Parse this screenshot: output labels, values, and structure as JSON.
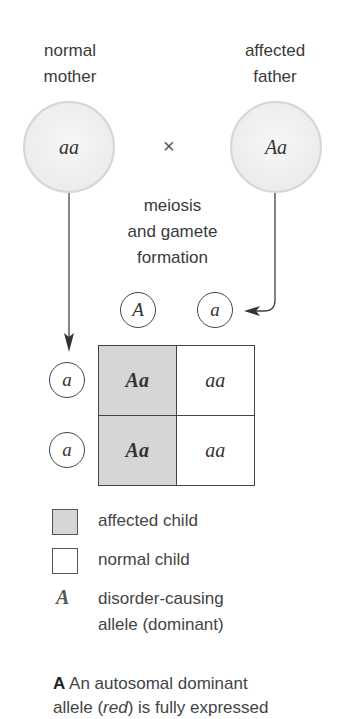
{
  "parents": {
    "mother": {
      "label_line1": "normal",
      "label_line2": "mother",
      "genotype": "aa"
    },
    "father": {
      "label_line1": "affected",
      "label_line2": "father",
      "genotype": "Aa"
    },
    "cross_symbol": "×"
  },
  "process": {
    "line1": "meiosis",
    "line2": "and gamete",
    "line3": "formation"
  },
  "gametes": {
    "father": [
      "A",
      "a"
    ],
    "mother": [
      "a",
      "a"
    ]
  },
  "punnett": {
    "rows": [
      [
        {
          "genotype": "Aa",
          "status": "affected"
        },
        {
          "genotype": "aa",
          "status": "normal"
        }
      ],
      [
        {
          "genotype": "Aa",
          "status": "affected"
        },
        {
          "genotype": "aa",
          "status": "normal"
        }
      ]
    ]
  },
  "legend": {
    "affected": "affected child",
    "normal": "normal child",
    "allele_symbol": "A",
    "allele_line1": "disorder-causing",
    "allele_line2": "allele (dominant)"
  },
  "caption": {
    "panel_letter": "A",
    "text_line1": "An autosomal dominant",
    "line2_pre": "allele (",
    "line2_italic": "red",
    "line2_post": ") is fully expressed"
  },
  "colors": {
    "affected_fill": "#d6d6d6",
    "normal_fill": "#ffffff",
    "parent_fill": "#ececec",
    "line": "#444444"
  }
}
